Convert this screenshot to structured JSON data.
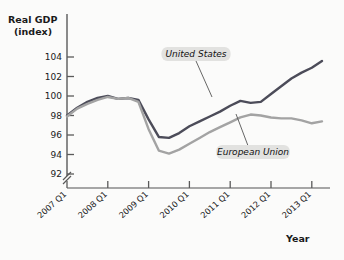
{
  "chart_data": {
    "type": "line",
    "title": "",
    "subtitle": "",
    "ylabel_line1": "Real GDP",
    "ylabel_line2": "(index)",
    "xlabel": "Year",
    "ylim": [
      91,
      105.2
    ],
    "yticks": [
      92,
      94,
      96,
      98,
      100,
      102,
      104
    ],
    "ytick_labels": [
      "92",
      "94",
      "96",
      "98",
      "100",
      "102",
      "104"
    ],
    "axis_break": true,
    "grid": false,
    "legend_position": "inline-annotations",
    "xtick_labels": [
      "2007 Q1",
      "2008 Q1",
      "2009 Q1",
      "2010 Q1",
      "2011 Q1",
      "2012 Q1",
      "2013 Q1"
    ],
    "x": [
      "2007 Q1",
      "2007 Q2",
      "2007 Q3",
      "2007 Q4",
      "2008 Q1",
      "2008 Q2",
      "2008 Q3",
      "2008 Q4",
      "2009 Q1",
      "2009 Q2",
      "2009 Q3",
      "2009 Q4",
      "2010 Q1",
      "2010 Q2",
      "2010 Q3",
      "2010 Q4",
      "2011 Q1",
      "2011 Q2",
      "2011 Q3",
      "2011 Q4",
      "2012 Q1",
      "2012 Q2",
      "2012 Q3",
      "2012 Q4",
      "2013 Q1",
      "2013 Q2"
    ],
    "series": [
      {
        "name": "United States",
        "color": "#4c4c59",
        "values": [
          98.0,
          98.8,
          99.4,
          99.8,
          100.0,
          99.7,
          99.8,
          99.6,
          97.6,
          95.8,
          95.7,
          96.2,
          96.9,
          97.4,
          97.9,
          98.4,
          99.0,
          99.5,
          99.3,
          99.4,
          100.2,
          101.0,
          101.8,
          102.4,
          102.9,
          103.6
        ]
      },
      {
        "name": "European Union",
        "color": "#a3a3a3",
        "values": [
          97.9,
          98.7,
          99.2,
          99.6,
          99.9,
          99.7,
          99.8,
          99.4,
          96.6,
          94.4,
          94.1,
          94.5,
          95.1,
          95.7,
          96.3,
          96.8,
          97.3,
          97.8,
          98.1,
          98.0,
          97.8,
          97.7,
          97.7,
          97.5,
          97.2,
          97.4
        ]
      }
    ],
    "annotations": [
      {
        "name": "United States",
        "label_x": 196,
        "label_y": 55,
        "leader_to_x": 212,
        "leader_to_y": 97
      },
      {
        "name": "European Union",
        "label_x": 253,
        "label_y": 153,
        "leader_to_x": 236,
        "leader_to_y": 114
      }
    ]
  }
}
